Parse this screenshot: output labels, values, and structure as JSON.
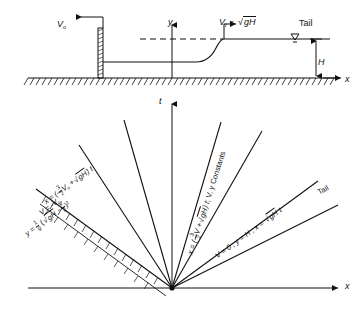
{
  "figure": {
    "ink_color": "#111111",
    "background": "#ffffff"
  },
  "upper_diagram": {
    "name": "physical-schematic",
    "axes": {
      "x_label": "x",
      "y_label": "y"
    },
    "labels": {
      "upstream_velocity": "V",
      "upstream_velocity_sub": "o",
      "tail_velocity": "V",
      "tail_velocity_sub": "t",
      "equals": "=",
      "sqrt_radicand": "gH",
      "tail_word": "Tail",
      "depth": "H"
    },
    "features": {
      "gate": "hatched-vertical-gate",
      "ground": "hatched-ground-line",
      "water_surface": "rising-profile-curve",
      "dashed_level": "upstream-dashed-level",
      "water_level_symbol": "inverted-triangle"
    }
  },
  "lower_diagram": {
    "name": "x-t-characteristics",
    "axes": {
      "x_label": "x",
      "t_label": "t"
    },
    "rays": [
      {
        "id": "ray-negative-wave",
        "angle_deg": 152,
        "labels": [
          "x = (-3/2 Vo + √gH ) t",
          "V = -Vo",
          "y = 1/g ( √gH - Vo/2 )²"
        ],
        "hatched": true
      },
      {
        "id": "ray-2",
        "angle_deg": 123,
        "labels": []
      },
      {
        "id": "ray-3",
        "angle_deg": 107,
        "labels": []
      },
      {
        "id": "ray-t-axis",
        "angle_deg": 90,
        "labels": []
      },
      {
        "id": "ray-4",
        "angle_deg": 73,
        "labels": []
      },
      {
        "id": "ray-general-characteristic",
        "angle_deg": 62,
        "labels": [
          "x = (-3/2 V + √gH ) t ; V, y Constants"
        ]
      },
      {
        "id": "ray-still-water",
        "angle_deg": 36,
        "labels": [
          "V = 0 ; y = H ; x = √gH t"
        ]
      },
      {
        "id": "ray-tail",
        "angle_deg": 28,
        "labels": [
          "Tail"
        ]
      }
    ],
    "text": {
      "eq_x_neg": "x = (-",
      "frac32_num": "3",
      "frac32_den": "2",
      "V": "V",
      "sub_o": "o",
      "plus": "+",
      "radicand_gH": "gH",
      "close_t": ") t",
      "V_eq_negVo": "V = -V",
      "y_eq": "y =",
      "frac1g_num": "1",
      "frac1g_den": "g",
      "open_paren": "(",
      "minus": "−",
      "frac_Vo_num": "V",
      "frac_Vo_den": "2",
      "close_sq": ")",
      "sq_exp": "2",
      "semicolon_constants": "; V, y Constants",
      "V_eq_0": "V = 0 ; y = H ; x =",
      "t_suffix": "t",
      "tail_word": "Tail"
    }
  }
}
